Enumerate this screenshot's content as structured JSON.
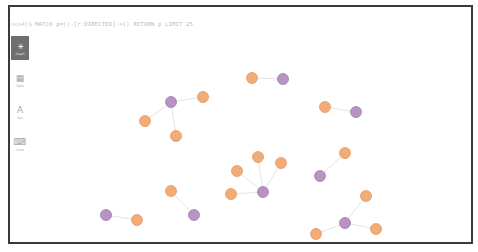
{
  "query": {
    "prompt": "neo4j$",
    "text": "MATCH p=()-[r:DIRECTED]->() RETURN p LIMIT 25"
  },
  "sidebar": {
    "items": [
      {
        "id": "graph",
        "label": "Graph",
        "glyph": "⚹",
        "active": true
      },
      {
        "id": "table",
        "label": "Table",
        "glyph": "▦",
        "active": false
      },
      {
        "id": "text",
        "label": "Text",
        "glyph": "A",
        "active": false
      },
      {
        "id": "code",
        "label": "Code",
        "glyph": "⌨",
        "active": false
      }
    ]
  },
  "colors": {
    "movie": "#f2a66b",
    "movie_stroke": "#e0905a",
    "person": "#b08bc0",
    "person_stroke": "#9a74ab",
    "edge": "#dcdcdc"
  },
  "graph": {
    "relationship": "DIRECTED",
    "nodes": [
      {
        "id": "m1",
        "type": "movie",
        "x": 252,
        "y": 78
      },
      {
        "id": "p1",
        "type": "person",
        "x": 283,
        "y": 79
      },
      {
        "id": "m2",
        "type": "movie",
        "x": 203,
        "y": 97
      },
      {
        "id": "p2",
        "type": "person",
        "x": 171,
        "y": 102
      },
      {
        "id": "m3",
        "type": "movie",
        "x": 145,
        "y": 121
      },
      {
        "id": "m4",
        "type": "movie",
        "x": 176,
        "y": 136
      },
      {
        "id": "m5",
        "type": "movie",
        "x": 325,
        "y": 107
      },
      {
        "id": "p3",
        "type": "person",
        "x": 356,
        "y": 112
      },
      {
        "id": "m6",
        "type": "movie",
        "x": 345,
        "y": 153
      },
      {
        "id": "p4",
        "type": "person",
        "x": 320,
        "y": 176
      },
      {
        "id": "m7",
        "type": "movie",
        "x": 258,
        "y": 157
      },
      {
        "id": "m8",
        "type": "movie",
        "x": 281,
        "y": 163
      },
      {
        "id": "m9",
        "type": "movie",
        "x": 237,
        "y": 171
      },
      {
        "id": "m10",
        "type": "movie",
        "x": 231,
        "y": 194
      },
      {
        "id": "p5",
        "type": "person",
        "x": 263,
        "y": 192
      },
      {
        "id": "m11",
        "type": "movie",
        "x": 171,
        "y": 191
      },
      {
        "id": "p6",
        "type": "person",
        "x": 194,
        "y": 215
      },
      {
        "id": "p7",
        "type": "person",
        "x": 106,
        "y": 215
      },
      {
        "id": "m12",
        "type": "movie",
        "x": 137,
        "y": 220
      },
      {
        "id": "m13",
        "type": "movie",
        "x": 366,
        "y": 196
      },
      {
        "id": "p8",
        "type": "person",
        "x": 345,
        "y": 223
      },
      {
        "id": "m14",
        "type": "movie",
        "x": 316,
        "y": 234
      },
      {
        "id": "m15",
        "type": "movie",
        "x": 376,
        "y": 229
      }
    ],
    "edges": [
      {
        "from": "p1",
        "to": "m1"
      },
      {
        "from": "p2",
        "to": "m2"
      },
      {
        "from": "p2",
        "to": "m3"
      },
      {
        "from": "p2",
        "to": "m4"
      },
      {
        "from": "p3",
        "to": "m5"
      },
      {
        "from": "p4",
        "to": "m6"
      },
      {
        "from": "p5",
        "to": "m7"
      },
      {
        "from": "p5",
        "to": "m8"
      },
      {
        "from": "p5",
        "to": "m9"
      },
      {
        "from": "p5",
        "to": "m10"
      },
      {
        "from": "p6",
        "to": "m11"
      },
      {
        "from": "p7",
        "to": "m12"
      },
      {
        "from": "p8",
        "to": "m13"
      },
      {
        "from": "p8",
        "to": "m14"
      },
      {
        "from": "p8",
        "to": "m15"
      }
    ]
  }
}
